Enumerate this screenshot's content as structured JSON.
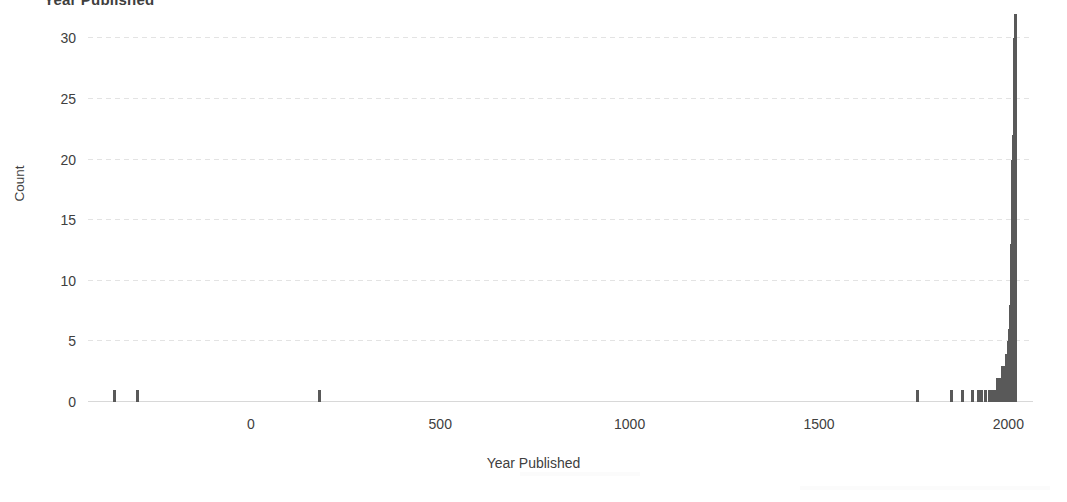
{
  "chart_data": {
    "type": "bar",
    "title": "Year Published",
    "subtitle": "",
    "xlabel": "Year Published",
    "ylabel": "Count",
    "xlim": [
      -430,
      2065
    ],
    "ylim": [
      0,
      32.5
    ],
    "xticks": [
      0,
      500,
      1000,
      1500,
      2000
    ],
    "xtick_labels": [
      "0",
      "500",
      "1000",
      "1500",
      "2000"
    ],
    "yticks": [
      0,
      5,
      10,
      15,
      20,
      25,
      30
    ],
    "ytick_labels": [
      "0",
      "5",
      "10",
      "15",
      "20",
      "25",
      "30"
    ],
    "grid": "horizontal",
    "legend": "none",
    "bar_color": "#595959",
    "background_color": "#ffffff",
    "bin_width": 10,
    "x": [
      -360,
      -330,
      -300,
      180,
      1760,
      1850,
      1865,
      1880,
      1905,
      1920,
      1930,
      1940,
      1945,
      1950,
      1955,
      1960,
      1963,
      1966,
      1969,
      1972,
      1975,
      1978,
      1980,
      1982,
      1984,
      1986,
      1988,
      1990,
      1992,
      1994,
      1995,
      1996,
      1997,
      1998,
      1999,
      2000,
      2001,
      2002,
      2003,
      2004,
      2005,
      2006,
      2007,
      2008,
      2009,
      2010,
      2011,
      2012,
      2013,
      2014,
      2015,
      2016,
      2017,
      2018,
      2019,
      2020
    ],
    "values": [
      1,
      0,
      1,
      1,
      1,
      1,
      0,
      1,
      1,
      1,
      1,
      1,
      0,
      1,
      1,
      1,
      1,
      1,
      1,
      2,
      1,
      2,
      2,
      1,
      3,
      2,
      2,
      1,
      3,
      2,
      4,
      2,
      3,
      3,
      2,
      5,
      4,
      4,
      5,
      6,
      7,
      8,
      9,
      11,
      13,
      16,
      19,
      20,
      20,
      22,
      26,
      26,
      30,
      32,
      20,
      3
    ],
    "series": [
      {
        "name": "Count",
        "values": [
          1,
          0,
          1,
          1,
          1,
          1,
          0,
          1,
          1,
          1,
          1,
          1,
          0,
          1,
          1,
          1,
          1,
          1,
          1,
          2,
          1,
          2,
          2,
          1,
          3,
          2,
          2,
          1,
          3,
          2,
          4,
          2,
          3,
          3,
          2,
          5,
          4,
          4,
          5,
          6,
          7,
          8,
          9,
          11,
          13,
          16,
          19,
          20,
          20,
          22,
          26,
          26,
          30,
          32,
          20,
          3
        ]
      }
    ]
  }
}
